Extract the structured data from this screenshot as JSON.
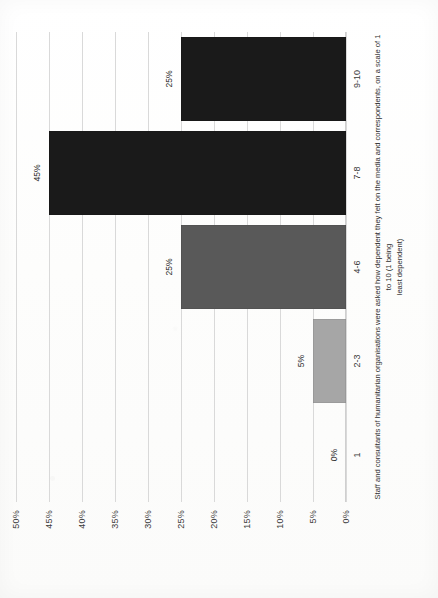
{
  "chart_data": {
    "type": "bar",
    "title": "",
    "subtitle": "",
    "categories": [
      "1",
      "2-3",
      "4-6",
      "7-8",
      "9-10"
    ],
    "values": [
      0,
      5,
      25,
      45,
      25
    ],
    "value_labels": [
      "0%",
      "5%",
      "25%",
      "45%",
      "25%"
    ],
    "bar_colors": [
      "#bfbfbf",
      "#a6a6a6",
      "#595959",
      "#1a1a1a",
      "#1a1a1a"
    ],
    "series": [
      {
        "name": "Share of respondents",
        "values": [
          0,
          5,
          25,
          45,
          25
        ]
      }
    ],
    "xlabel": "",
    "ylabel": "",
    "ylim": [
      0,
      50
    ],
    "ytick_values": [
      50,
      45,
      40,
      35,
      30,
      25,
      20,
      15,
      10,
      5,
      0
    ],
    "ytick_labels": [
      "50%",
      "45%",
      "40%",
      "35%",
      "30%",
      "25%",
      "20%",
      "15%",
      "10%",
      "5%",
      "0%"
    ],
    "grid": true,
    "legend": "none",
    "orientation": "vertical-bars-rotated-90ccw",
    "caption_line_1": "Staff and consultants of humanitarian organisations were asked how dependent they felt on the media and correspondents, on a scale of 1 to 10 (1 being",
    "caption_line_2": "least dependent)"
  },
  "page": {
    "background_color": "#ffffff",
    "grid_color": "#d9d9d9",
    "text_color": "#333333"
  }
}
